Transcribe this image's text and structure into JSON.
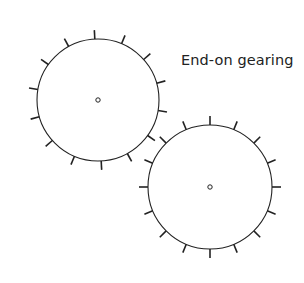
{
  "diagram": {
    "caption": "End-on gearing",
    "stroke_color": "#222222",
    "background": "#ffffff",
    "gears": [
      {
        "name": "gear-left",
        "cx": 98,
        "cy": 100,
        "r": 61,
        "tooth_count": 14,
        "tooth_start_deg": 93,
        "tooth_length": 9,
        "hub_r": 2.2
      },
      {
        "name": "gear-right",
        "cx": 210,
        "cy": 187,
        "r": 62,
        "tooth_count": 16,
        "tooth_start_deg": 0,
        "tooth_length": 9,
        "hub_r": 2.2
      }
    ]
  }
}
